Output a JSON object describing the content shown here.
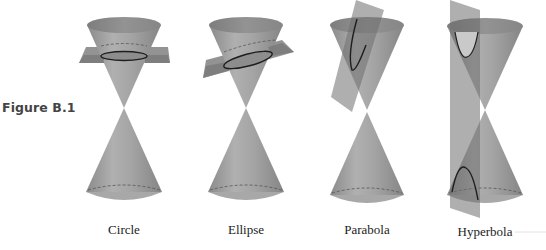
{
  "figure": {
    "label": "Figure B.1"
  },
  "colors": {
    "cone_light": "#b4b4b4",
    "cone_mid": "#969696",
    "cone_dark": "#7a7a7a",
    "plane": "#6e6e6e",
    "curve": "#1e1e1e",
    "background": "#ffffff"
  },
  "panels": [
    {
      "id": "circle",
      "caption": "Circle",
      "cx": 124
    },
    {
      "id": "ellipse",
      "caption": "Ellipse",
      "cx": 246
    },
    {
      "id": "parabola",
      "caption": "Parabola",
      "cx": 367
    },
    {
      "id": "hyperbola",
      "caption": "Hyperbola",
      "cx": 485
    }
  ]
}
